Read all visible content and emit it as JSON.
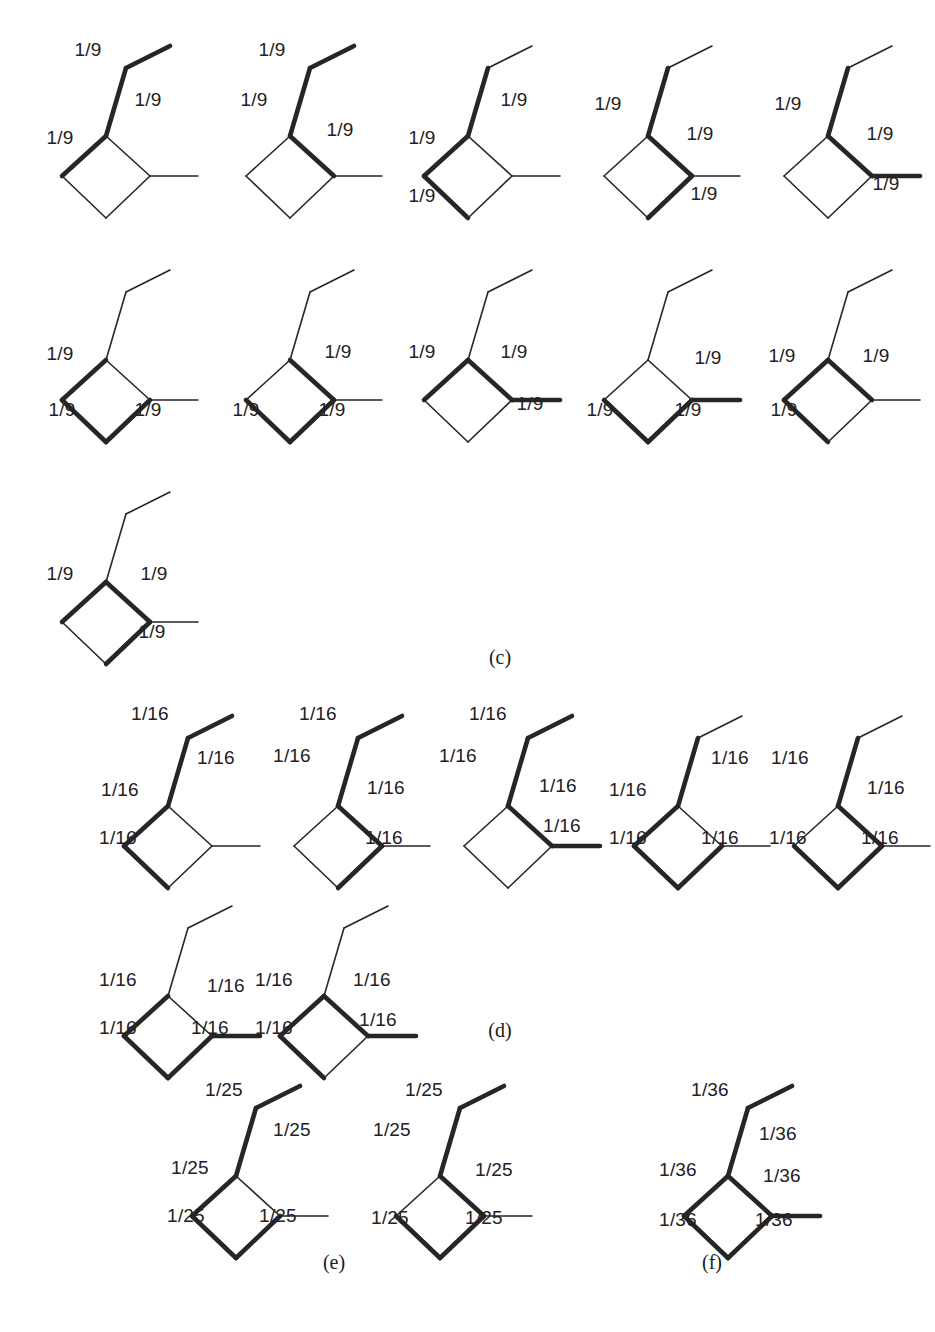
{
  "figure": {
    "type": "chemical-structure-grid",
    "bond_label_note": "Each labelled bond carries a numeric weight fraction",
    "line_color": "#262626",
    "thin_width": 1.6,
    "bold_width": 4.6
  },
  "sections": [
    {
      "id": "c",
      "tag": "(c)",
      "tag_x": 500,
      "tag_y": 657,
      "weight": "1/9",
      "structures": [
        {
          "x": 30,
          "y": 28,
          "bold": [
            "methyl",
            "ch2",
            "ring_ul"
          ],
          "labels": [
            {
              "text": "1/9",
              "x": 58,
              "y": 22
            },
            {
              "text": "1/9",
              "x": 118,
              "y": 72
            },
            {
              "text": "1/9",
              "x": 30,
              "y": 110
            }
          ]
        },
        {
          "x": 214,
          "y": 28,
          "bold": [
            "methyl",
            "ch2",
            "ring_ur"
          ],
          "labels": [
            {
              "text": "1/9",
              "x": 58,
              "y": 22
            },
            {
              "text": "1/9",
              "x": 126,
              "y": 102
            },
            {
              "text": "1/9",
              "x": 40,
              "y": 72
            }
          ]
        },
        {
          "x": 392,
          "y": 28,
          "bold": [
            "ch2",
            "ring_ul",
            "ring_ll"
          ],
          "labels": [
            {
              "text": "1/9",
              "x": 122,
              "y": 72
            },
            {
              "text": "1/9",
              "x": 30,
              "y": 110
            },
            {
              "text": "1/9",
              "x": 30,
              "y": 168
            }
          ]
        },
        {
          "x": 572,
          "y": 28,
          "bold": [
            "ch2",
            "ring_ur",
            "ring_lr"
          ],
          "labels": [
            {
              "text": "1/9",
              "x": 36,
              "y": 76
            },
            {
              "text": "1/9",
              "x": 128,
              "y": 106
            },
            {
              "text": "1/9",
              "x": 132,
              "y": 166
            }
          ]
        },
        {
          "x": 752,
          "y": 28,
          "bold": [
            "ch2",
            "ring_ur",
            "exo"
          ],
          "labels": [
            {
              "text": "1/9",
              "x": 36,
              "y": 76
            },
            {
              "text": "1/9",
              "x": 128,
              "y": 106
            },
            {
              "text": "1/9",
              "x": 134,
              "y": 156
            }
          ]
        },
        {
          "x": 30,
          "y": 252,
          "bold": [
            "ring_ul",
            "ring_ll",
            "ring_lr"
          ],
          "labels": [
            {
              "text": "1/9",
              "x": 30,
              "y": 102
            },
            {
              "text": "1/9",
              "x": 32,
              "y": 158
            },
            {
              "text": "1/9",
              "x": 118,
              "y": 158
            }
          ]
        },
        {
          "x": 214,
          "y": 252,
          "bold": [
            "ring_ur",
            "ring_ll",
            "ring_lr"
          ],
          "labels": [
            {
              "text": "1/9",
              "x": 124,
              "y": 100
            },
            {
              "text": "1/9",
              "x": 32,
              "y": 158
            },
            {
              "text": "1/9",
              "x": 118,
              "y": 158
            }
          ]
        },
        {
          "x": 392,
          "y": 252,
          "bold": [
            "ring_ul",
            "ring_ur",
            "exo"
          ],
          "labels": [
            {
              "text": "1/9",
              "x": 30,
              "y": 100
            },
            {
              "text": "1/9",
              "x": 122,
              "y": 100
            },
            {
              "text": "1/9",
              "x": 138,
              "y": 152
            }
          ]
        },
        {
          "x": 572,
          "y": 252,
          "bold": [
            "ring_ll",
            "ring_lr",
            "exo"
          ],
          "labels": [
            {
              "text": "1/9",
              "x": 136,
              "y": 106
            },
            {
              "text": "1/9",
              "x": 28,
              "y": 158
            },
            {
              "text": "1/9",
              "x": 116,
              "y": 158
            }
          ]
        },
        {
          "x": 752,
          "y": 252,
          "bold": [
            "ring_ul",
            "ring_ur",
            "ring_ll"
          ],
          "labels": [
            {
              "text": "1/9",
              "x": 30,
              "y": 104
            },
            {
              "text": "1/9",
              "x": 124,
              "y": 104
            },
            {
              "text": "1/9",
              "x": 32,
              "y": 158
            }
          ]
        },
        {
          "x": 30,
          "y": 474,
          "bold": [
            "ring_ul",
            "ring_ur",
            "ring_lr"
          ],
          "labels": [
            {
              "text": "1/9",
              "x": 30,
              "y": 100
            },
            {
              "text": "1/9",
              "x": 124,
              "y": 100
            },
            {
              "text": "1/9",
              "x": 122,
              "y": 158
            }
          ]
        }
      ]
    },
    {
      "id": "d",
      "tag": "(d)",
      "tag_x": 500,
      "tag_y": 1030,
      "weight": "1/16",
      "structures": [
        {
          "x": 92,
          "y": 698,
          "bold": [
            "methyl",
            "ch2",
            "ring_ul",
            "ring_ll"
          ],
          "labels": [
            {
              "text": "1/16",
              "x": 58,
              "y": 16
            },
            {
              "text": "1/16",
              "x": 124,
              "y": 60
            },
            {
              "text": "1/16",
              "x": 28,
              "y": 92
            },
            {
              "text": "1/16",
              "x": 26,
              "y": 140
            }
          ]
        },
        {
          "x": 262,
          "y": 698,
          "bold": [
            "methyl",
            "ch2",
            "ring_ur",
            "ring_lr"
          ],
          "labels": [
            {
              "text": "1/16",
              "x": 56,
              "y": 16
            },
            {
              "text": "1/16",
              "x": 30,
              "y": 58
            },
            {
              "text": "1/16",
              "x": 124,
              "y": 90
            },
            {
              "text": "1/16",
              "x": 122,
              "y": 140
            }
          ]
        },
        {
          "x": 432,
          "y": 698,
          "bold": [
            "methyl",
            "ch2",
            "ring_ur",
            "exo"
          ],
          "labels": [
            {
              "text": "1/16",
              "x": 56,
              "y": 16
            },
            {
              "text": "1/16",
              "x": 26,
              "y": 58
            },
            {
              "text": "1/16",
              "x": 126,
              "y": 88
            },
            {
              "text": "1/16",
              "x": 130,
              "y": 128
            }
          ]
        },
        {
          "x": 602,
          "y": 698,
          "bold": [
            "ch2",
            "ring_ul",
            "ring_ll",
            "ring_lr"
          ],
          "labels": [
            {
              "text": "1/16",
              "x": 128,
              "y": 60
            },
            {
              "text": "1/16",
              "x": 26,
              "y": 92
            },
            {
              "text": "1/16",
              "x": 26,
              "y": 140
            },
            {
              "text": "1/16",
              "x": 118,
              "y": 140
            }
          ]
        },
        {
          "x": 762,
          "y": 698,
          "bold": [
            "ch2",
            "ring_ur",
            "ring_ll",
            "ring_lr"
          ],
          "labels": [
            {
              "text": "1/16",
              "x": 28,
              "y": 60
            },
            {
              "text": "1/16",
              "x": 124,
              "y": 90
            },
            {
              "text": "1/16",
              "x": 26,
              "y": 140
            },
            {
              "text": "1/16",
              "x": 118,
              "y": 140
            }
          ]
        },
        {
          "x": 92,
          "y": 888,
          "bold": [
            "ring_ul",
            "ring_ll",
            "ring_lr",
            "exo"
          ],
          "labels": [
            {
              "text": "1/16",
              "x": 26,
              "y": 92
            },
            {
              "text": "1/16",
              "x": 134,
              "y": 98
            },
            {
              "text": "1/16",
              "x": 26,
              "y": 140
            },
            {
              "text": "1/16",
              "x": 118,
              "y": 140
            }
          ]
        },
        {
          "x": 248,
          "y": 888,
          "bold": [
            "ring_ul",
            "ring_ur",
            "ring_ll",
            "exo"
          ],
          "labels": [
            {
              "text": "1/16",
              "x": 26,
              "y": 92
            },
            {
              "text": "1/16",
              "x": 124,
              "y": 92
            },
            {
              "text": "1/16",
              "x": 26,
              "y": 140
            },
            {
              "text": "1/16",
              "x": 130,
              "y": 132
            }
          ]
        }
      ]
    },
    {
      "id": "e",
      "tag": "(e)",
      "tag_x": 334,
      "tag_y": 1262,
      "weight": "1/25",
      "structures": [
        {
          "x": 160,
          "y": 1068,
          "bold": [
            "methyl",
            "ch2",
            "ring_ul",
            "ring_ll",
            "ring_lr"
          ],
          "labels": [
            {
              "text": "1/25",
              "x": 64,
              "y": 22
            },
            {
              "text": "1/25",
              "x": 132,
              "y": 62
            },
            {
              "text": "1/25",
              "x": 30,
              "y": 100
            },
            {
              "text": "1/25",
              "x": 26,
              "y": 148
            },
            {
              "text": "1/25",
              "x": 118,
              "y": 148
            }
          ]
        },
        {
          "x": 364,
          "y": 1068,
          "bold": [
            "methyl",
            "ch2",
            "ring_ur",
            "ring_ll",
            "ring_lr"
          ],
          "labels": [
            {
              "text": "1/25",
              "x": 60,
              "y": 22
            },
            {
              "text": "1/25",
              "x": 28,
              "y": 62
            },
            {
              "text": "1/25",
              "x": 130,
              "y": 102
            },
            {
              "text": "1/25",
              "x": 26,
              "y": 150
            },
            {
              "text": "1/25",
              "x": 120,
              "y": 150
            }
          ]
        }
      ]
    },
    {
      "id": "f",
      "tag": "(f)",
      "tag_x": 712,
      "tag_y": 1262,
      "weight": "1/36",
      "structures": [
        {
          "x": 652,
          "y": 1068,
          "bold": [
            "methyl",
            "ch2",
            "ring_ul",
            "ring_ur",
            "ring_ll",
            "ring_lr",
            "exo"
          ],
          "labels": [
            {
              "text": "1/36",
              "x": 58,
              "y": 22
            },
            {
              "text": "1/36",
              "x": 126,
              "y": 66
            },
            {
              "text": "1/36",
              "x": 26,
              "y": 102
            },
            {
              "text": "1/36",
              "x": 130,
              "y": 108
            },
            {
              "text": "1/36",
              "x": 26,
              "y": 152
            },
            {
              "text": "1/36",
              "x": 122,
              "y": 152
            }
          ]
        }
      ]
    }
  ],
  "caption": {
    "text": "",
    "y": 1310
  }
}
